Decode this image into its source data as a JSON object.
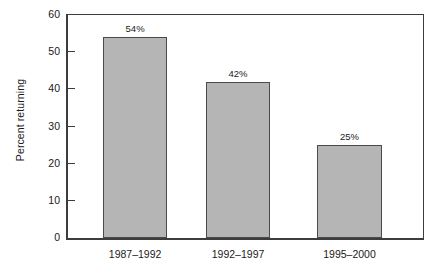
{
  "chart_data": {
    "type": "bar",
    "title": "",
    "subtitle": "",
    "xlabel": "",
    "ylabel": "Percent returning",
    "categories": [
      "1987–1992",
      "1992–1997",
      "1995–2000"
    ],
    "values": [
      54,
      42,
      25
    ],
    "data_labels": [
      "54%",
      "42%",
      "25%"
    ],
    "ylim": [
      0,
      60
    ],
    "yticks": [
      0,
      10,
      20,
      30,
      40,
      50,
      60
    ],
    "ytick_labels": [
      "0",
      "10",
      "20",
      "30",
      "40",
      "50",
      "60"
    ],
    "grid": false,
    "legend": null,
    "legend_position": "none",
    "colors": {
      "bar_fill": "#b5b5b5",
      "bar_stroke": "#4a4a4a",
      "axis": "#3d3d3d",
      "text": "#1a1a1a",
      "background": "#ffffff"
    }
  }
}
